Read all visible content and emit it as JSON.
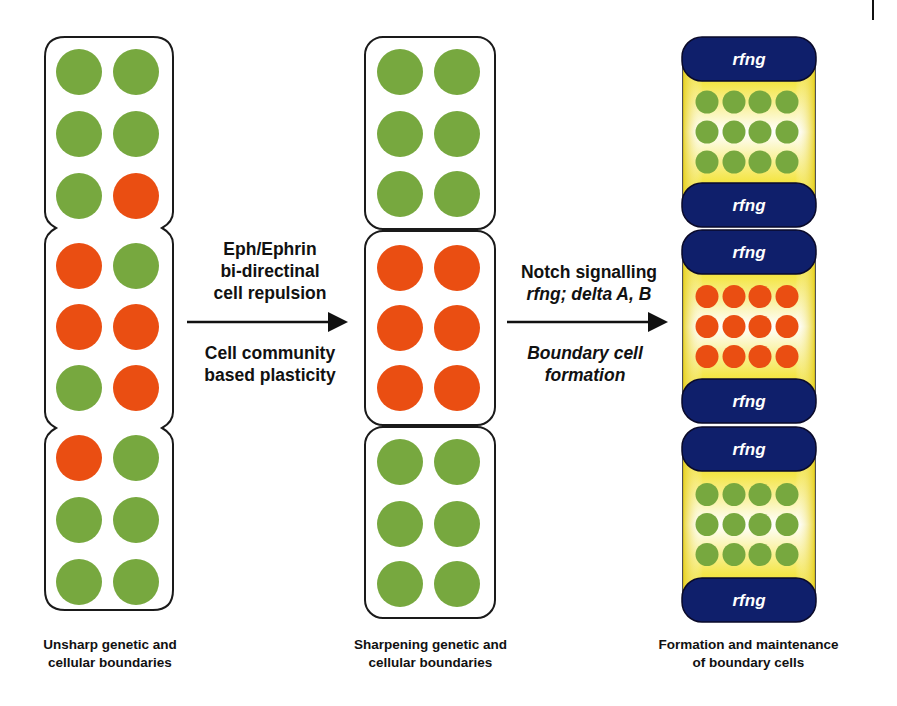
{
  "colors": {
    "green": "#77a83f",
    "red": "#ea4e12",
    "navy": "#0f1f6b",
    "yellow": "#f3e23a",
    "outline": "#1a1a1a"
  },
  "stages": [
    {
      "id": "unsharp",
      "caption_line1": "Unsharp genetic and",
      "caption_line2": "cellular boundaries",
      "grid_columns": 2,
      "cells": [
        [
          "green",
          "green"
        ],
        [
          "green",
          "green"
        ],
        [
          "green",
          "red"
        ],
        [
          "red",
          "green"
        ],
        [
          "red",
          "red"
        ],
        [
          "green",
          "red"
        ],
        [
          "red",
          "green"
        ],
        [
          "green",
          "green"
        ],
        [
          "green",
          "green"
        ]
      ]
    },
    {
      "id": "sharpening",
      "caption_line1": "Sharpening genetic and",
      "caption_line2": "cellular boundaries",
      "grid_columns": 2,
      "compartments": [
        {
          "cells": [
            [
              "green",
              "green"
            ],
            [
              "green",
              "green"
            ],
            [
              "green",
              "green"
            ]
          ]
        },
        {
          "cells": [
            [
              "red",
              "red"
            ],
            [
              "red",
              "red"
            ],
            [
              "red",
              "red"
            ]
          ]
        },
        {
          "cells": [
            [
              "green",
              "green"
            ],
            [
              "green",
              "green"
            ],
            [
              "green",
              "green"
            ]
          ]
        }
      ]
    },
    {
      "id": "boundary-cells",
      "caption_line1": "Formation and maintenance",
      "caption_line2": "of boundary cells",
      "cap_label": "rfng",
      "grid_columns": 4,
      "compartments": [
        {
          "color": "green",
          "rows": 3,
          "top_label": "rfng",
          "bottom_label": "rfng"
        },
        {
          "color": "red",
          "rows": 3,
          "top_label": "rfng",
          "bottom_label": "rfng"
        },
        {
          "color": "green",
          "rows": 3,
          "top_label": "rfng",
          "bottom_label": "rfng"
        }
      ]
    }
  ],
  "transitions": [
    {
      "above": [
        "Eph/Ephrin",
        "bi-directinal",
        "cell repulsion"
      ],
      "below": [
        "Cell community",
        "based plasticity"
      ]
    },
    {
      "above_line1": "Notch signalling",
      "above_line2": "rfng; delta A, B",
      "below": [
        "Boundary cell",
        "formation"
      ]
    }
  ]
}
